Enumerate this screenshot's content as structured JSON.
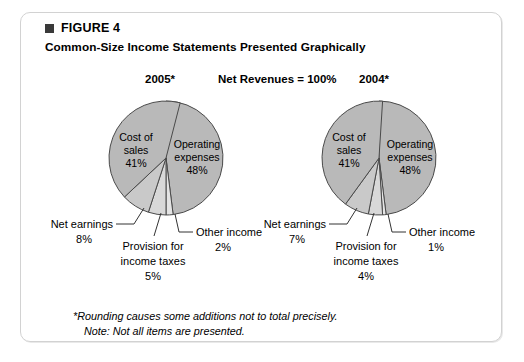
{
  "figure": {
    "bullet_icon": "square-bullet",
    "label": "FIGURE 4",
    "title": "Common-Size Income Statements Presented Graphically"
  },
  "headings": {
    "left_year": "2005*",
    "center": "Net Revenues = 100%",
    "right_year": "2004*"
  },
  "footnotes": {
    "line1": "*Rounding causes some additions not to total precisely.",
    "line2": "Note: Not all items are presented."
  },
  "colors": {
    "slice_dark": "#b9b9b9",
    "slice_mid": "#c9c9c9",
    "slice_light": "#d8d8d8",
    "slice_pale": "#e4e4e4",
    "outline": "#4a4a4a",
    "border": "#d2d2d2",
    "text": "#000000"
  },
  "chart_data": [
    {
      "type": "pie",
      "title": "2005*",
      "subtitle": "Net Revenues = 100%",
      "categories": [
        "Operating expenses",
        "Other income",
        "Provision for income taxes",
        "Net earnings",
        "Cost of sales"
      ],
      "values": [
        48,
        2,
        5,
        8,
        41
      ],
      "labels_inside": [
        {
          "name": "Cost of sales",
          "line1": "Cost of",
          "line2": "sales",
          "value": "41%"
        },
        {
          "name": "Operating expenses",
          "line1": "Operating",
          "line2": "expenses",
          "value": "48%"
        }
      ],
      "labels_callout": [
        {
          "name": "Net earnings",
          "text": "Net earnings",
          "value": "8%"
        },
        {
          "name": "Provision for income taxes",
          "line1": "Provision for",
          "line2": "income taxes",
          "value": "5%"
        },
        {
          "name": "Other income",
          "text": "Other income",
          "value": "2%"
        }
      ]
    },
    {
      "type": "pie",
      "title": "2004*",
      "subtitle": "Net Revenues = 100%",
      "categories": [
        "Operating expenses",
        "Other income",
        "Provision for income taxes",
        "Net earnings",
        "Cost of sales"
      ],
      "values": [
        48,
        1,
        4,
        7,
        41
      ],
      "labels_inside": [
        {
          "name": "Cost of sales",
          "line1": "Cost of",
          "line2": "sales",
          "value": "41%"
        },
        {
          "name": "Operating expenses",
          "line1": "Operating",
          "line2": "expenses",
          "value": "48%"
        }
      ],
      "labels_callout": [
        {
          "name": "Net earnings",
          "text": "Net earnings",
          "value": "7%"
        },
        {
          "name": "Provision for income taxes",
          "line1": "Provision for",
          "line2": "income taxes",
          "value": "4%"
        },
        {
          "name": "Other income",
          "text": "Other income",
          "value": "1%"
        }
      ]
    }
  ]
}
